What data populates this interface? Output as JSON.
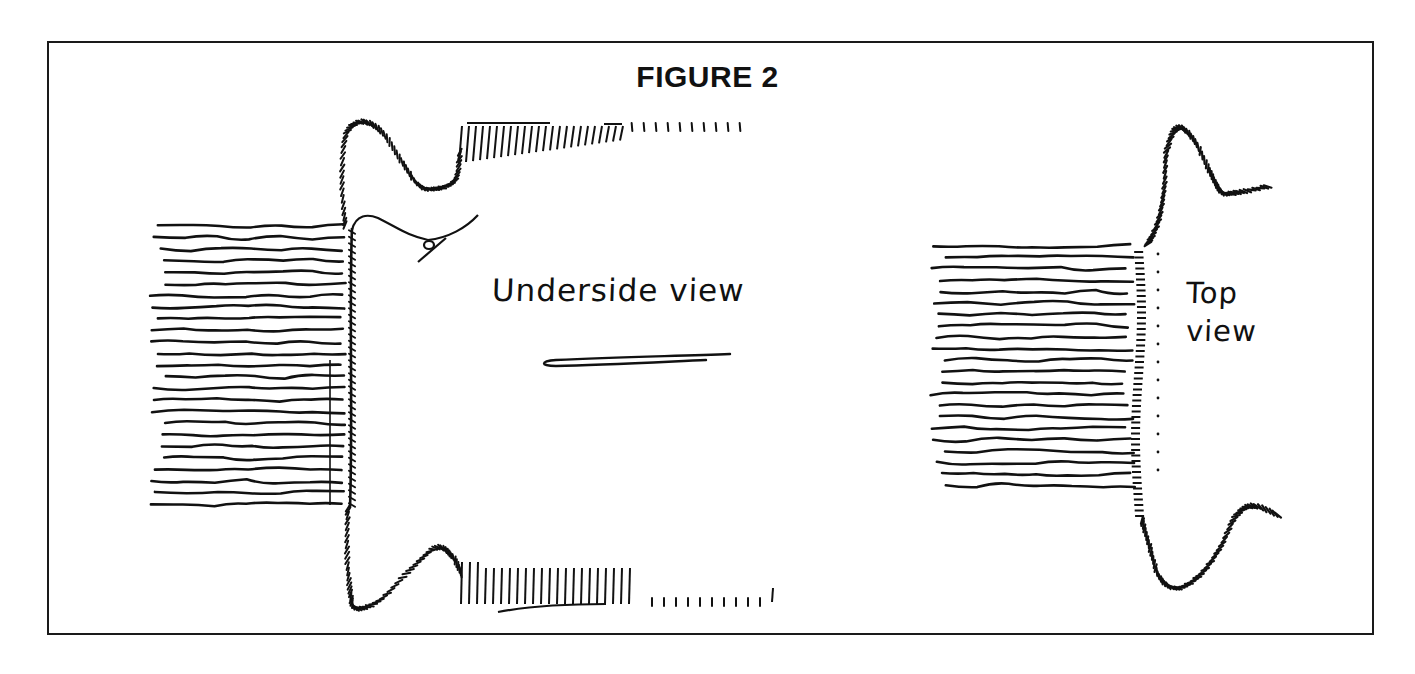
{
  "figure": {
    "title": "FIGURE 2",
    "labels": {
      "underside": "Underside view",
      "top_line1": "Top",
      "top_line2": "view"
    },
    "views": [
      {
        "id": "underside-view",
        "description": "Rug edge seen from underside with whipstitched binding, needle and thread"
      },
      {
        "id": "top-view",
        "description": "Rug edge seen from top with hooked binding tape"
      }
    ],
    "ink_color": "#111111",
    "background_color": "#ffffff"
  }
}
